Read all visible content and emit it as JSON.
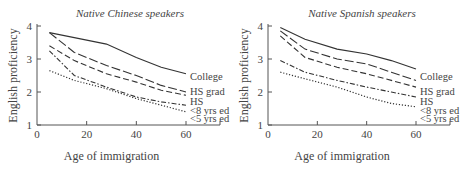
{
  "chart_data": [
    {
      "type": "line",
      "title": "Native Chinese speakers",
      "xlabel": "Age of immigration",
      "ylabel": "English proficiency",
      "xlim": [
        0,
        75
      ],
      "ylim": [
        1,
        4
      ],
      "xticks": [
        0,
        20,
        40,
        60
      ],
      "yticks": [
        1,
        2,
        3,
        4
      ],
      "grid": false,
      "legend_position": "inline-right",
      "series": [
        {
          "name": "College",
          "style": "solid",
          "x": [
            5,
            15,
            28,
            40,
            50,
            60
          ],
          "values": [
            3.8,
            3.65,
            3.45,
            3.05,
            2.75,
            2.55
          ]
        },
        {
          "name": "HS grad",
          "style": "long-dash",
          "x": [
            5,
            15,
            28,
            40,
            50,
            60
          ],
          "values": [
            3.8,
            3.2,
            2.8,
            2.5,
            2.2,
            2.0
          ]
        },
        {
          "name": "HS",
          "style": "dash",
          "x": [
            5,
            15,
            28,
            40,
            50,
            60
          ],
          "values": [
            3.4,
            2.95,
            2.55,
            2.3,
            2.05,
            1.9
          ]
        },
        {
          "name": "<8 yrs ed",
          "style": "dash-dot",
          "x": [
            5,
            15,
            28,
            40,
            50,
            60
          ],
          "values": [
            3.25,
            2.5,
            2.15,
            1.85,
            1.7,
            1.6
          ]
        },
        {
          "name": "<5 yrs ed",
          "style": "dotted",
          "x": [
            5,
            15,
            28,
            40,
            50,
            60
          ],
          "values": [
            2.65,
            2.35,
            2.1,
            1.8,
            1.6,
            1.4
          ]
        }
      ]
    },
    {
      "type": "line",
      "title": "Native Spanish speakers",
      "xlabel": "Age of immigration",
      "ylabel": "English proficiency",
      "xlim": [
        0,
        75
      ],
      "ylim": [
        1,
        4
      ],
      "xticks": [
        0,
        20,
        40,
        60
      ],
      "yticks": [
        1,
        2,
        3,
        4
      ],
      "grid": false,
      "legend_position": "inline-right",
      "series": [
        {
          "name": "College",
          "style": "solid",
          "x": [
            5,
            15,
            28,
            40,
            50,
            60
          ],
          "values": [
            3.95,
            3.6,
            3.3,
            3.15,
            2.95,
            2.7
          ]
        },
        {
          "name": "HS grad",
          "style": "long-dash",
          "x": [
            5,
            15,
            28,
            40,
            50,
            60
          ],
          "values": [
            3.85,
            3.3,
            3.0,
            2.85,
            2.6,
            2.35
          ]
        },
        {
          "name": "HS",
          "style": "dash",
          "x": [
            5,
            15,
            28,
            40,
            50,
            60
          ],
          "values": [
            3.7,
            3.05,
            2.75,
            2.55,
            2.35,
            2.15
          ]
        },
        {
          "name": "<8 yrs ed",
          "style": "dash-dot",
          "x": [
            5,
            15,
            28,
            40,
            50,
            60
          ],
          "values": [
            2.95,
            2.6,
            2.35,
            2.15,
            2.0,
            1.85
          ]
        },
        {
          "name": "<5 yrs ed",
          "style": "dotted",
          "x": [
            5,
            15,
            28,
            40,
            50,
            60
          ],
          "values": [
            2.6,
            2.4,
            2.15,
            1.85,
            1.65,
            1.55
          ]
        }
      ]
    }
  ]
}
